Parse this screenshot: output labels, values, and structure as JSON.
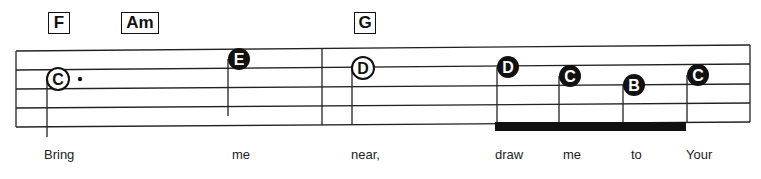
{
  "chords": [
    {
      "label": "F",
      "x": 48,
      "w": 22
    },
    {
      "label": "Am",
      "x": 121,
      "w": 38
    },
    {
      "label": "G",
      "x": 354,
      "w": 22
    }
  ],
  "notes": [
    {
      "letter": "C",
      "style": "open",
      "x": 58,
      "y": 79,
      "dotted": true
    },
    {
      "letter": "E",
      "style": "filled",
      "x": 239,
      "y": 59
    },
    {
      "letter": "D",
      "style": "open",
      "x": 363,
      "y": 68
    },
    {
      "letter": "D",
      "style": "filled",
      "x": 508,
      "y": 67
    },
    {
      "letter": "C",
      "style": "filled",
      "x": 570,
      "y": 76
    },
    {
      "letter": "B",
      "style": "filled",
      "x": 634,
      "y": 85
    },
    {
      "letter": "C",
      "style": "filled",
      "x": 698,
      "y": 75
    }
  ],
  "lyrics": [
    {
      "text": "Bring",
      "x": 44
    },
    {
      "text": "me",
      "x": 232
    },
    {
      "text": "near,",
      "x": 351
    },
    {
      "text": "draw",
      "x": 495
    },
    {
      "text": "me",
      "x": 563
    },
    {
      "text": "to",
      "x": 631
    },
    {
      "text": "Your",
      "x": 686
    }
  ]
}
